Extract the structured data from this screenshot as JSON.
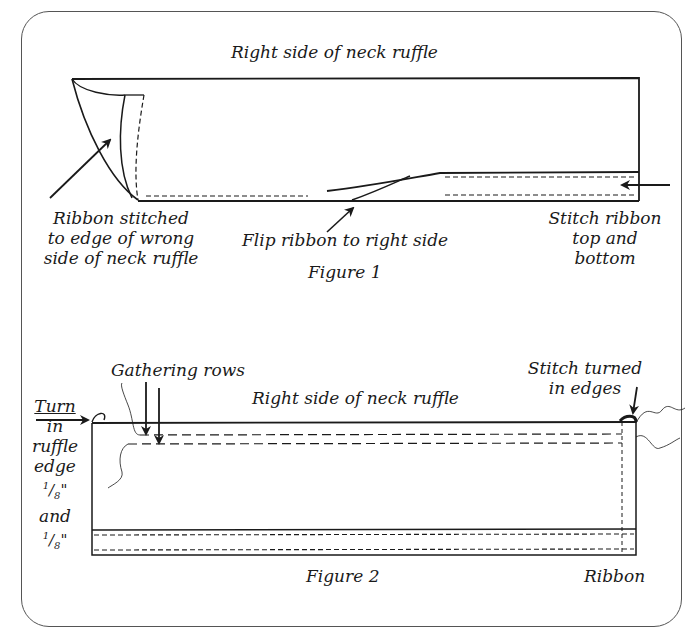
{
  "figure1": {
    "title": "Right side of  neck ruffle",
    "caption": "Figure 1",
    "labels": {
      "ribbon_stitched": [
        "Ribbon stitched",
        "to edge of wrong",
        "side of neck ruffle"
      ],
      "flip_ribbon": "Flip ribbon to right side",
      "stitch_ribbon": [
        "Stitch ribbon",
        "top and",
        "bottom"
      ]
    }
  },
  "figure2": {
    "title": "Right side of neck ruffle",
    "caption": "Figure 2",
    "labels": {
      "gathering_rows": "Gathering rows",
      "turn_in": [
        "Turn",
        "in",
        "ruffle",
        "edge"
      ],
      "fraction1": {
        "num": "1",
        "den": "8",
        "unit": "\""
      },
      "and": "and",
      "fraction2": {
        "num": "1",
        "den": "8",
        "unit": "\""
      },
      "stitch_turned": [
        "Stitch turned",
        "in edges"
      ],
      "ribbon": "Ribbon"
    }
  },
  "colors": {
    "ink": "#1a1a1a",
    "frame": "#555555",
    "background": "#ffffff"
  }
}
